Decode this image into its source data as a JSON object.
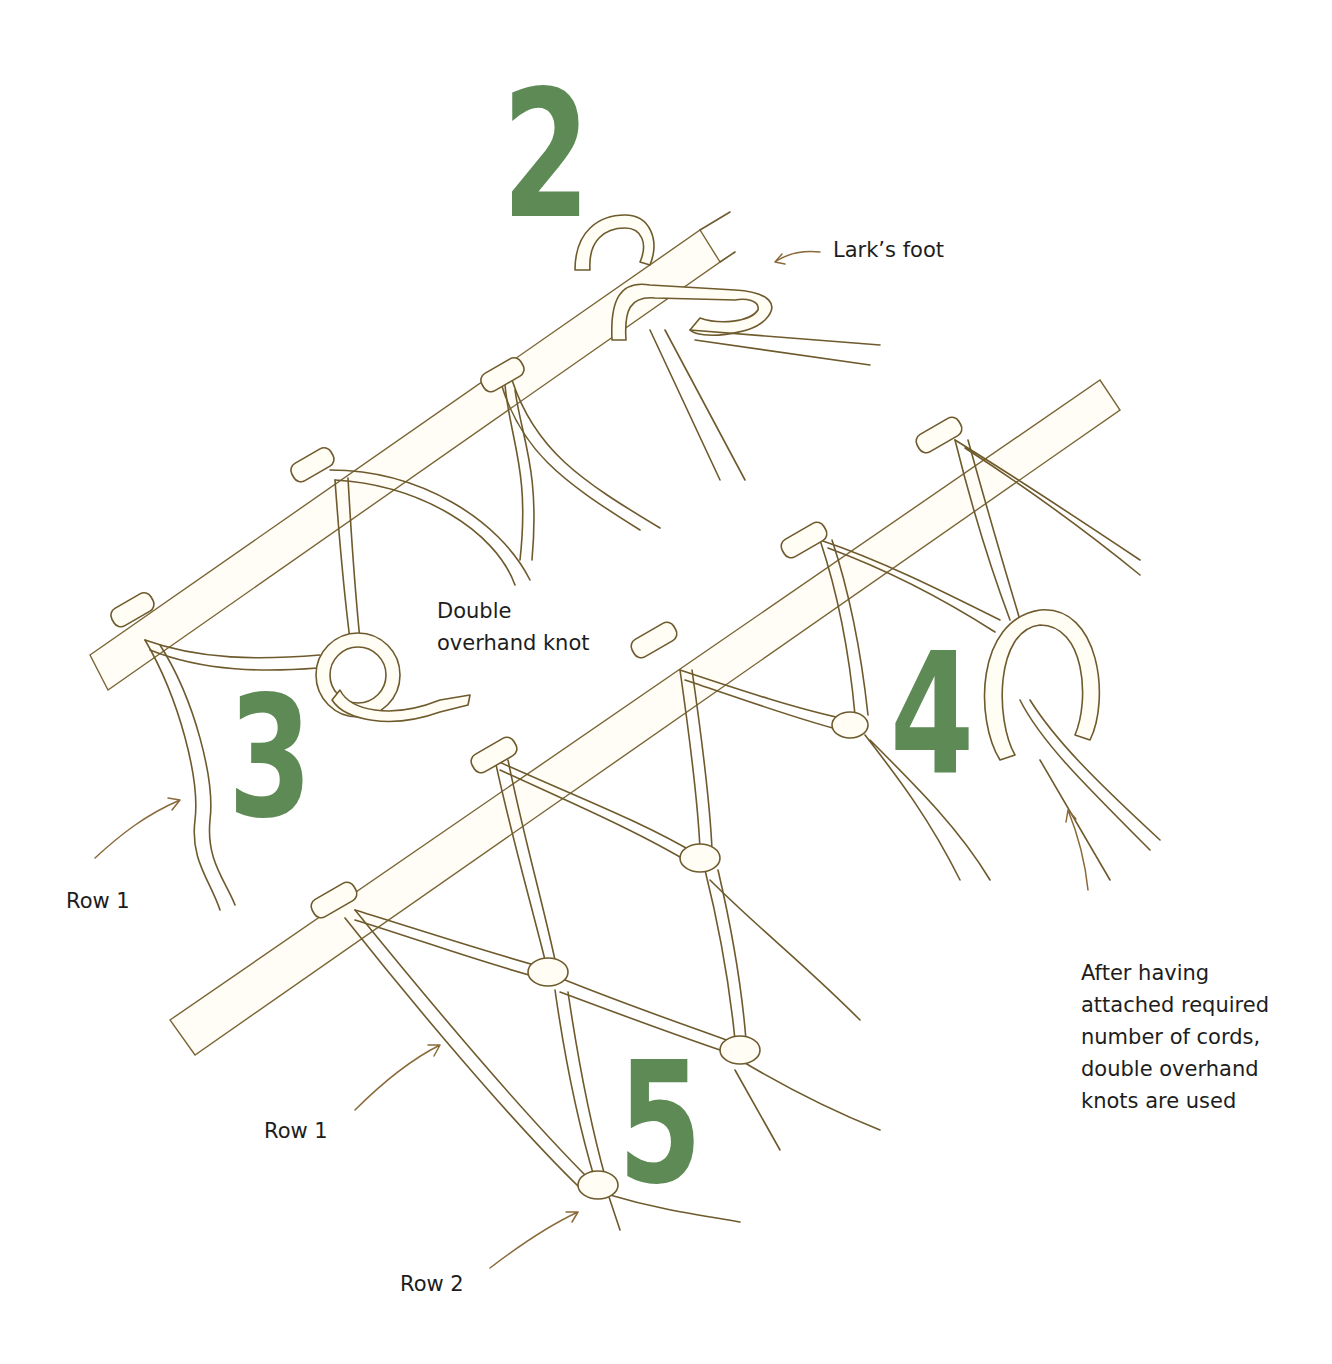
{
  "figure": {
    "colors": {
      "numeral": "#5e8a55",
      "cord_outline": "#6e5a2c",
      "arrow": "#8a6a3a",
      "text": "#1d1d1d",
      "background": "#ffffff"
    },
    "steps": [
      {
        "number": "2",
        "label": "Lark’s foot"
      },
      {
        "number": "3",
        "label_lines": [
          "Double",
          "overhand knot"
        ]
      },
      {
        "number": "4"
      },
      {
        "number": "5"
      }
    ],
    "annotations": {
      "row1_left": "Row 1",
      "row1_bottom": "Row 1",
      "row2_bottom": "Row 2",
      "note_lines": [
        "After having",
        "attached required",
        "number of cords,",
        "double overhand",
        "knots are used"
      ]
    }
  }
}
